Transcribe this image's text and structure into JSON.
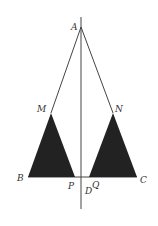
{
  "diagram": {
    "type": "geometry-figure",
    "labels": {
      "A": "A",
      "M": "M",
      "N": "N",
      "B": "B",
      "P": "P",
      "Q": "Q",
      "C": "C",
      "D": "D"
    },
    "points": {
      "A": [
        81,
        27
      ],
      "M": [
        51,
        113
      ],
      "N": [
        113,
        113
      ],
      "B": [
        28,
        177
      ],
      "P": [
        75,
        177
      ],
      "Q": [
        89,
        177
      ],
      "C": [
        137,
        177
      ]
    },
    "colors": {
      "line": "#444444",
      "fill": "#222222",
      "background": "#ffffff"
    },
    "shaded_triangles": [
      [
        "B",
        "M",
        "P"
      ],
      [
        "Q",
        "N",
        "C"
      ]
    ],
    "segments": [
      [
        "A",
        "M"
      ],
      [
        "A",
        "N"
      ],
      [
        "B",
        "C"
      ]
    ],
    "axis_line": {
      "x": 81,
      "y_top": 17,
      "y_bottom": 209
    }
  }
}
